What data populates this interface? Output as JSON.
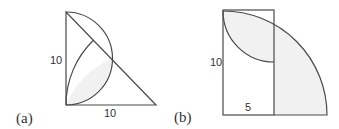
{
  "colors": {
    "line": "#4a4a4a",
    "shade": "#f1f1f1",
    "text": "#333333",
    "background": "#ffffff"
  },
  "figure_a": {
    "caption": "(a)",
    "label_vertical": "10",
    "label_horizontal": "10",
    "description": "Right isosceles triangle with legs 10; semicircle on the vertical leg; arc centered at the bottom-right vertex with radius 10; shaded lens region"
  },
  "figure_b": {
    "caption": "(b)",
    "label_vertical": "10",
    "label_horizontal": "5",
    "description": "Rectangle 5 by 10 with a quarter circle of radius 10 centered at bottom-left; inner quarter arc of radius 5 centered at top-right of rectangle; shaded regions"
  }
}
